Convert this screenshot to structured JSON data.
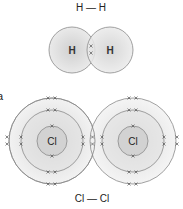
{
  "figure_label": "a",
  "h2": {
    "formula": "H — H",
    "atoms": [
      {
        "symbol": "H",
        "cx": 72,
        "cy": 50,
        "r": 23
      },
      {
        "symbol": "H",
        "cx": 110,
        "cy": 50,
        "r": 23
      }
    ],
    "shared_electrons": 2
  },
  "cl2": {
    "formula": "Cl — Cl",
    "atoms": [
      {
        "symbol": "Cl",
        "cx": 52,
        "cy": 141,
        "shells": [
          15,
          31,
          43
        ]
      },
      {
        "symbol": "Cl",
        "cx": 133,
        "cy": 141,
        "shells": [
          15,
          31,
          43
        ]
      }
    ],
    "shared_electrons": 2
  },
  "colors": {
    "shell_stroke": "#888888",
    "fill_center": "#d4d4d4",
    "fill_edge": "#efefef",
    "text": "#222222"
  }
}
